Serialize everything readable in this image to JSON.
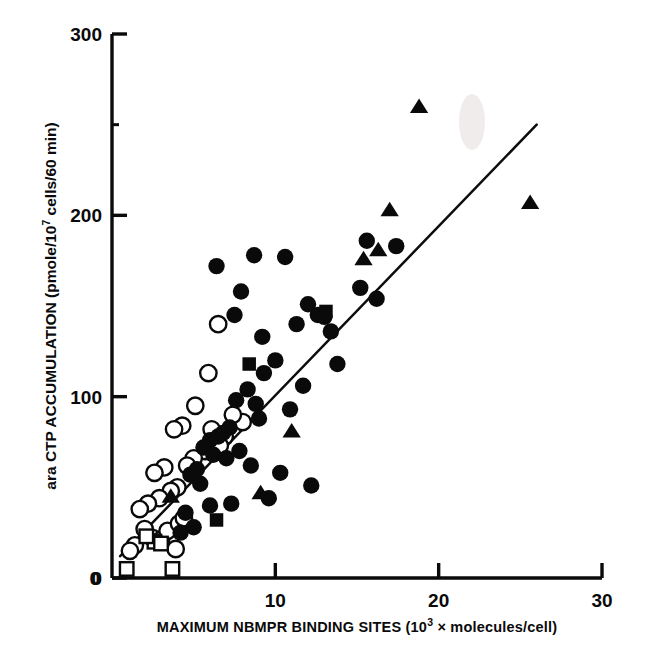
{
  "chart_data": {
    "type": "scatter",
    "title": "",
    "xlabel": "MAXIMUM NBMPR BINDING SITES (10³ × molecules/cell)",
    "xlabel_parts": {
      "pre": "MAXIMUM NBMPR BINDING SITES (10",
      "sup": "3",
      "post": " × molecules/cell)"
    },
    "ylabel": "ara CTP ACCUMULATION (pmole/10⁷ cells/60 min)",
    "ylabel_parts": {
      "pre": "ara CTP ACCUMULATION (pmole/10",
      "sup": "7",
      "post": " cells/60 min)"
    },
    "xlim": [
      0,
      30
    ],
    "ylim": [
      0,
      300
    ],
    "xticks": [
      0,
      10,
      20,
      30
    ],
    "xtick_labels": [
      "0",
      "10",
      "20",
      "30"
    ],
    "yticks": [
      0,
      100,
      200,
      300
    ],
    "ytick_labels": [
      "0",
      "100",
      "200",
      "300"
    ],
    "y_minor_ticks": [
      250
    ],
    "grid": false,
    "legend": "none",
    "axis_style": "left-and-bottom-spines",
    "fit_line": {
      "label": "linear regression line",
      "x_start": 0.5,
      "y_start": 12,
      "x_end": 26.0,
      "y_end": 250
    },
    "series": [
      {
        "name": "filled-circles",
        "marker": "filled-circle",
        "color": "#0a0a0a",
        "points": [
          [
            6.4,
            172
          ],
          [
            8.7,
            178
          ],
          [
            10.6,
            177
          ],
          [
            7.5,
            145
          ],
          [
            7.9,
            158
          ],
          [
            9.2,
            133
          ],
          [
            12.0,
            151
          ],
          [
            11.3,
            140
          ],
          [
            10.0,
            120
          ],
          [
            9.3,
            113
          ],
          [
            12.6,
            145
          ],
          [
            13.0,
            144
          ],
          [
            13.4,
            136
          ],
          [
            16.2,
            154
          ],
          [
            17.4,
            183
          ],
          [
            15.6,
            186
          ],
          [
            8.3,
            104
          ],
          [
            7.6,
            98
          ],
          [
            8.8,
            96
          ],
          [
            9.0,
            88
          ],
          [
            7.2,
            83
          ],
          [
            6.8,
            80
          ],
          [
            6.5,
            78
          ],
          [
            6.0,
            76
          ],
          [
            5.6,
            72
          ],
          [
            6.2,
            68
          ],
          [
            7.0,
            66
          ],
          [
            5.2,
            60
          ],
          [
            4.8,
            57
          ],
          [
            5.4,
            52
          ],
          [
            7.8,
            70
          ],
          [
            8.5,
            62
          ],
          [
            10.3,
            58
          ],
          [
            12.2,
            51
          ],
          [
            9.6,
            44
          ],
          [
            7.3,
            41
          ],
          [
            6.0,
            40
          ],
          [
            4.5,
            36
          ],
          [
            5.0,
            28
          ],
          [
            4.2,
            25
          ],
          [
            10.9,
            93
          ],
          [
            11.7,
            106
          ],
          [
            13.8,
            118
          ],
          [
            15.2,
            160
          ]
        ]
      },
      {
        "name": "open-circles",
        "marker": "open-circle",
        "color": "#ffffff",
        "points": [
          [
            6.5,
            140
          ],
          [
            5.9,
            113
          ],
          [
            5.1,
            95
          ],
          [
            4.3,
            84
          ],
          [
            3.8,
            82
          ],
          [
            3.2,
            61
          ],
          [
            2.6,
            58
          ],
          [
            6.1,
            82
          ],
          [
            6.9,
            78
          ],
          [
            6.6,
            73
          ],
          [
            5.7,
            70
          ],
          [
            5.0,
            66
          ],
          [
            4.6,
            62
          ],
          [
            4.0,
            50
          ],
          [
            3.6,
            48
          ],
          [
            2.9,
            44
          ],
          [
            2.2,
            41
          ],
          [
            1.7,
            38
          ],
          [
            2.0,
            27
          ],
          [
            2.5,
            22
          ],
          [
            3.0,
            21
          ],
          [
            3.4,
            26
          ],
          [
            4.1,
            30
          ],
          [
            4.4,
            33
          ],
          [
            1.4,
            18
          ],
          [
            1.1,
            15
          ],
          [
            3.9,
            16
          ],
          [
            8.0,
            86
          ],
          [
            7.4,
            90
          ]
        ]
      },
      {
        "name": "filled-triangles",
        "marker": "filled-triangle",
        "color": "#0a0a0a",
        "points": [
          [
            18.8,
            260
          ],
          [
            17.0,
            203
          ],
          [
            25.6,
            207
          ],
          [
            16.3,
            181
          ],
          [
            15.4,
            176
          ],
          [
            11.0,
            81
          ],
          [
            9.1,
            47
          ],
          [
            3.6,
            45
          ]
        ]
      },
      {
        "name": "filled-squares",
        "marker": "filled-square",
        "color": "#0a0a0a",
        "points": [
          [
            8.4,
            118
          ],
          [
            13.1,
            147
          ],
          [
            6.4,
            32
          ]
        ]
      },
      {
        "name": "open-squares",
        "marker": "open-square",
        "color": "#ffffff",
        "points": [
          [
            0.9,
            5
          ],
          [
            3.7,
            5
          ],
          [
            2.6,
            20
          ],
          [
            3.0,
            19
          ],
          [
            2.1,
            23
          ]
        ]
      }
    ]
  }
}
